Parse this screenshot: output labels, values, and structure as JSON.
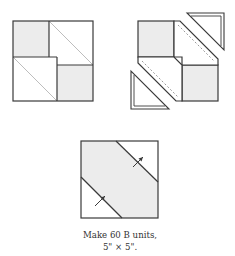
{
  "figures": [
    {
      "id": "original-block",
      "description": "Four-patch block with two grey squares and two half-square triangle units"
    },
    {
      "id": "exploded-block",
      "description": "Block with two corner triangles cut off along dashed seam lines"
    },
    {
      "id": "finished-b-unit",
      "description": "Resulting B unit with diagonal grey band and seam-pressing arrows"
    }
  ],
  "caption": {
    "line1": "Make 60 B units,",
    "line2": "5\" × 5\"."
  },
  "colors": {
    "outline": "#3a3a3a",
    "grey_fill": "#ececec",
    "light_diagonal": "#bdbdbd",
    "dashed_seam": "#9a9a9a",
    "text": "#333333"
  }
}
